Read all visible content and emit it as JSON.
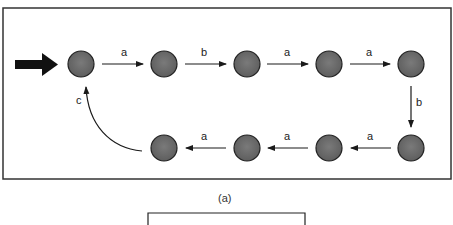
{
  "diagram": {
    "caption": "(a)",
    "start_arrow": "start-arrow",
    "nodes": [
      {
        "id": "n0",
        "x": 81,
        "y": 64
      },
      {
        "id": "n1",
        "x": 164,
        "y": 64
      },
      {
        "id": "n2",
        "x": 247,
        "y": 64
      },
      {
        "id": "n3",
        "x": 329,
        "y": 64
      },
      {
        "id": "n4",
        "x": 411,
        "y": 64
      },
      {
        "id": "n5",
        "x": 411,
        "y": 148
      },
      {
        "id": "n6",
        "x": 329,
        "y": 148
      },
      {
        "id": "n7",
        "x": 247,
        "y": 148
      },
      {
        "id": "n8",
        "x": 164,
        "y": 148
      }
    ],
    "edges": [
      {
        "from": "n0",
        "to": "n1",
        "label": "a"
      },
      {
        "from": "n1",
        "to": "n2",
        "label": "b"
      },
      {
        "from": "n2",
        "to": "n3",
        "label": "a"
      },
      {
        "from": "n3",
        "to": "n4",
        "label": "a"
      },
      {
        "from": "n4",
        "to": "n5",
        "label": "b"
      },
      {
        "from": "n5",
        "to": "n6",
        "label": "a"
      },
      {
        "from": "n6",
        "to": "n7",
        "label": "a"
      },
      {
        "from": "n7",
        "to": "n8",
        "label": "a"
      },
      {
        "from": "n8",
        "to": "n0",
        "label": "c"
      }
    ],
    "colors": {
      "node_fill": "#6e6e6e",
      "node_stroke": "#222222",
      "edge": "#1a1a1a",
      "frame": "#333333"
    }
  }
}
